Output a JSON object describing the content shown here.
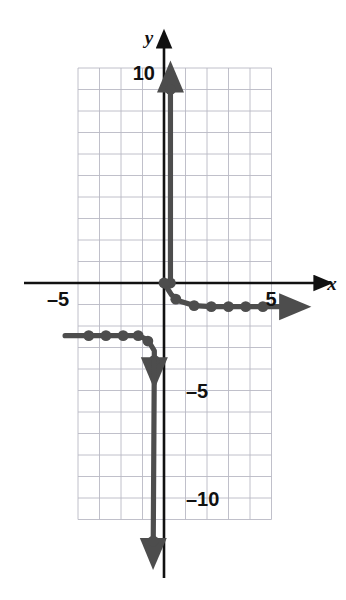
{
  "figure": {
    "name": "step-function-graph",
    "axis_labels": {
      "x": "x",
      "y": "y"
    },
    "tick_labels": {
      "x_negative_5": "–5",
      "x_positive_5": "5",
      "y_positive_10": "10",
      "y_negative_5": "–5",
      "y_negative_10": "–10"
    },
    "colors": {
      "curve": "#4d4d4d",
      "axis": "#111111",
      "grid": "#b9b9c4",
      "background": "#ffffff"
    }
  },
  "chart_data": {
    "type": "scatter",
    "title": "",
    "xlabel": "x",
    "ylabel": "y",
    "xlim": [
      -4.7,
      5.6
    ],
    "ylim": [
      -11.6,
      10.1
    ],
    "grid": true,
    "grid_step": 1,
    "legend": "none",
    "xticks": [
      -5,
      5
    ],
    "yticks": [
      10,
      -5,
      -10
    ],
    "xtick_labels": [
      "–5",
      "5"
    ],
    "ytick_labels": [
      "10",
      "–5",
      "–10"
    ],
    "annotations": [
      "Vertical asymptote-like branch rising from origin to y=9 with upward arrow",
      "Horizontal branch of plotted points descending from origin toward y=-1 with rightward arrow",
      "Horizontal branch of plotted points at y=-2.4 with leftward arrow",
      "Vertical branch descending from y=-3.6 to y=-12 with downward arrow"
    ],
    "series": [
      {
        "name": "upper-vertical-branch",
        "type": "line",
        "arrow": "up",
        "points": [
          [
            0.3,
            0.0
          ],
          [
            0.3,
            9.0
          ]
        ],
        "markers": [
          [
            0.3,
            0.0
          ],
          [
            0.3,
            9.0
          ]
        ]
      },
      {
        "name": "right-descending-branch",
        "type": "line",
        "arrow": "right",
        "points": [
          [
            0.0,
            0.0
          ],
          [
            0.35,
            -0.55
          ],
          [
            0.75,
            -0.85
          ],
          [
            1.4,
            -1.05
          ],
          [
            2.2,
            -1.1
          ],
          [
            3.0,
            -1.1
          ],
          [
            3.8,
            -1.1
          ],
          [
            4.6,
            -1.1
          ],
          [
            5.5,
            -1.1
          ]
        ],
        "markers": [
          [
            0.0,
            0.0
          ],
          [
            0.55,
            -0.75
          ],
          [
            1.4,
            -1.05
          ],
          [
            2.2,
            -1.1
          ],
          [
            3.0,
            -1.1
          ],
          [
            3.8,
            -1.1
          ],
          [
            4.6,
            -1.1
          ]
        ]
      },
      {
        "name": "left-horizontal-branch",
        "type": "line",
        "arrow": "left",
        "points": [
          [
            -4.6,
            -2.45
          ],
          [
            -3.5,
            -2.45
          ],
          [
            -2.7,
            -2.45
          ],
          [
            -1.9,
            -2.45
          ],
          [
            -1.2,
            -2.45
          ],
          [
            -0.75,
            -2.65
          ],
          [
            -0.45,
            -3.15
          ],
          [
            -0.45,
            -3.6
          ]
        ],
        "markers": [
          [
            -3.5,
            -2.45
          ],
          [
            -2.7,
            -2.45
          ],
          [
            -1.9,
            -2.45
          ],
          [
            -1.2,
            -2.45
          ],
          [
            -0.75,
            -2.7
          ],
          [
            -0.45,
            -3.6
          ]
        ]
      },
      {
        "name": "lower-vertical-branch",
        "type": "line",
        "arrow": "down",
        "points": [
          [
            -0.45,
            -3.6
          ],
          [
            -0.5,
            -12.0
          ]
        ],
        "markers": [
          [
            -0.5,
            -12.0
          ]
        ]
      }
    ]
  }
}
